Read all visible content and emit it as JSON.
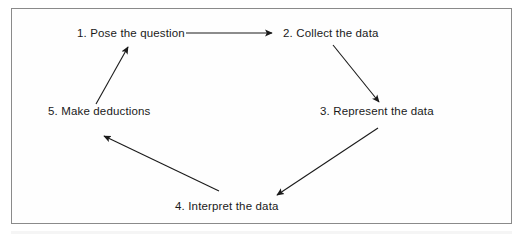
{
  "diagram": {
    "type": "cycle-diagram",
    "frame": {
      "border_color": "#8a8a8a",
      "background_color": "#fefefe"
    },
    "text_color": "#1a1a1a",
    "arrow_color": "#1a1a1a",
    "nodes": [
      {
        "id": "step-1",
        "number": "1.",
        "label": "1. Pose the question",
        "text": "Pose the question"
      },
      {
        "id": "step-2",
        "number": "2.",
        "label": "2. Collect the data",
        "text": "Collect the data"
      },
      {
        "id": "step-3",
        "number": "3.",
        "label": "3. Represent the data",
        "text": "Represent the data"
      },
      {
        "id": "step-4",
        "number": "4.",
        "label": "4. Interpret the data",
        "text": "Interpret the data"
      },
      {
        "id": "step-5",
        "number": "5.",
        "label": "5. Make deductions",
        "text": "Make deductions"
      }
    ],
    "arrows": [
      {
        "id": "arrow-1-to-2",
        "from": "step-1",
        "to": "step-2",
        "direction": "right"
      },
      {
        "id": "arrow-2-to-3",
        "from": "step-2",
        "to": "step-3",
        "direction": "down-right"
      },
      {
        "id": "arrow-3-to-4",
        "from": "step-3",
        "to": "step-4",
        "direction": "down-left"
      },
      {
        "id": "arrow-4-to-5",
        "from": "step-4",
        "to": "step-5",
        "direction": "up-left"
      },
      {
        "id": "arrow-5-to-1",
        "from": "step-5",
        "to": "step-1",
        "direction": "up-right"
      }
    ]
  }
}
